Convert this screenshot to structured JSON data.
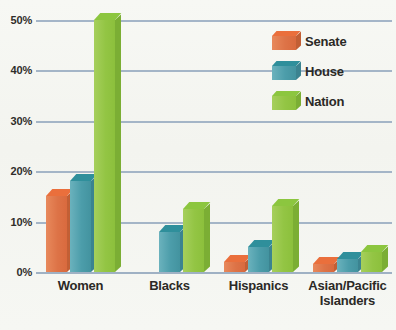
{
  "chart_data": {
    "type": "bar",
    "title": "",
    "xlabel": "",
    "ylabel": "",
    "ylim": [
      0,
      50
    ],
    "ytick_values": [
      0,
      10,
      20,
      30,
      40,
      50
    ],
    "ytick_labels": [
      "0%",
      "10%",
      "20%",
      "30%",
      "40%",
      "50%"
    ],
    "grid": true,
    "legend_position": "top-right",
    "categories": [
      "Women",
      "Blacks",
      "Hispanics",
      "Asian/Pacific Islanders"
    ],
    "category_labels": [
      {
        "line1": "Women",
        "line2": ""
      },
      {
        "line1": "Blacks",
        "line2": ""
      },
      {
        "line1": "Hispanics",
        "line2": ""
      },
      {
        "line1": "Asian/Pacific",
        "line2": "Islanders"
      }
    ],
    "series": [
      {
        "name": "Senate",
        "color": "#dd7347",
        "values": [
          15,
          0,
          2,
          1.5
        ]
      },
      {
        "name": "House",
        "color": "#4c9daa",
        "values": [
          18,
          8,
          5,
          2.5
        ]
      },
      {
        "name": "Nation",
        "color": "#93c544",
        "values": [
          50,
          12.5,
          13,
          4
        ]
      }
    ]
  },
  "legend": {
    "items": [
      {
        "label": "Senate"
      },
      {
        "label": "House"
      },
      {
        "label": "Nation"
      }
    ]
  },
  "colors": {
    "background": "#f5f6f2",
    "gridline": "#95a9c0",
    "text": "#2b2926",
    "senate": "#dd7347",
    "house": "#4c9daa",
    "nation": "#93c544"
  }
}
